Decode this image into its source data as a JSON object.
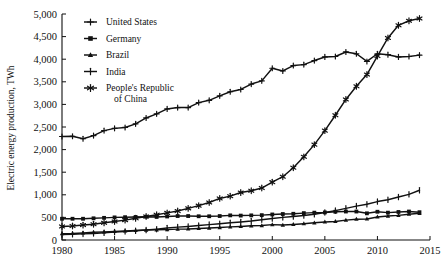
{
  "chart_data": {
    "type": "line",
    "title": "",
    "xlabel": "",
    "ylabel": "Electric energy production, TWh",
    "xlim": [
      1980,
      2015
    ],
    "ylim": [
      0,
      5000
    ],
    "grid": false,
    "legend_position": "top-left-inside",
    "x_ticks": [
      "1980",
      "1985",
      "1990",
      "1995",
      "2000",
      "2005",
      "2010",
      "2015"
    ],
    "y_ticks": [
      "0",
      "500",
      "1,000",
      "1,500",
      "2,000",
      "2,500",
      "3,000",
      "3,500",
      "4,000",
      "4,500",
      "5,000"
    ],
    "x": [
      1980,
      1981,
      1982,
      1983,
      1984,
      1985,
      1986,
      1987,
      1988,
      1989,
      1990,
      1991,
      1992,
      1993,
      1994,
      1995,
      1996,
      1997,
      1998,
      1999,
      2000,
      2001,
      2002,
      2003,
      2004,
      2005,
      2006,
      2007,
      2008,
      2009,
      2010,
      2011,
      2012,
      2013,
      2014
    ],
    "series": [
      {
        "name": "United States",
        "marker": "plus",
        "values": [
          2290,
          2295,
          2240,
          2310,
          2420,
          2470,
          2490,
          2570,
          2700,
          2790,
          2900,
          2930,
          2930,
          3040,
          3090,
          3190,
          3280,
          3330,
          3450,
          3520,
          3800,
          3740,
          3860,
          3880,
          3970,
          4050,
          4060,
          4160,
          4120,
          3950,
          4120,
          4100,
          4050,
          4060,
          4090
        ]
      },
      {
        "name": "Germany",
        "marker": "square",
        "values": [
          470,
          470,
          470,
          480,
          490,
          500,
          505,
          510,
          515,
          510,
          520,
          530,
          530,
          525,
          525,
          530,
          545,
          540,
          545,
          550,
          565,
          575,
          580,
          595,
          605,
          610,
          625,
          630,
          630,
          590,
          625,
          605,
          620,
          630,
          615
        ]
      },
      {
        "name": "Brazil",
        "marker": "triangle",
        "values": [
          140,
          145,
          155,
          170,
          180,
          190,
          200,
          210,
          220,
          225,
          230,
          240,
          245,
          255,
          265,
          275,
          290,
          300,
          315,
          320,
          340,
          330,
          345,
          360,
          380,
          400,
          410,
          440,
          460,
          465,
          510,
          530,
          545,
          570,
          590
        ]
      },
      {
        "name": "India",
        "marker": "ibeam",
        "values": [
          120,
          125,
          135,
          145,
          160,
          175,
          190,
          205,
          220,
          240,
          265,
          285,
          300,
          320,
          340,
          360,
          380,
          400,
          420,
          450,
          475,
          500,
          520,
          540,
          570,
          610,
          650,
          700,
          750,
          790,
          850,
          890,
          950,
          1010,
          1100
        ]
      },
      {
        "name": "People's Republic of China",
        "marker": "asterisk",
        "values": [
          300,
          310,
          330,
          350,
          380,
          410,
          440,
          480,
          520,
          560,
          600,
          640,
          700,
          760,
          830,
          920,
          970,
          1050,
          1090,
          1150,
          1280,
          1400,
          1600,
          1840,
          2110,
          2420,
          2760,
          3110,
          3400,
          3660,
          4070,
          4470,
          4750,
          4850,
          4900
        ]
      }
    ]
  },
  "legend": {
    "items": [
      {
        "label": "United States"
      },
      {
        "label": "Germany"
      },
      {
        "label": "Brazil"
      },
      {
        "label": "India"
      },
      {
        "label": "People's Republic",
        "label2": "of China"
      }
    ]
  }
}
